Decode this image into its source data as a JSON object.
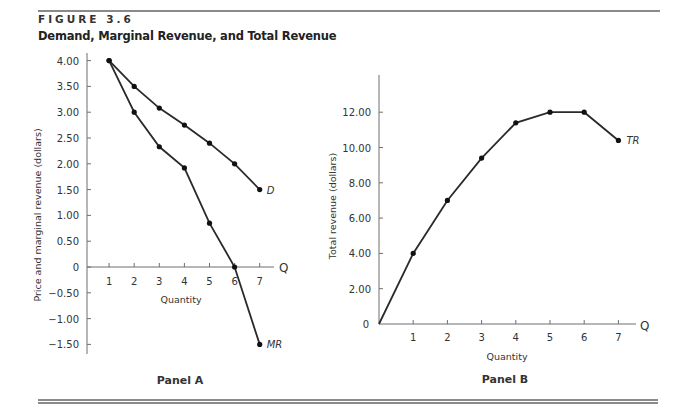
{
  "figure": {
    "number": "FIGURE 3.6",
    "title": "Demand, Marginal Revenue, and Total Revenue"
  },
  "chart_data": [
    {
      "type": "line",
      "panel": "Panel A",
      "title": "Panel A",
      "xlabel": "Quantity",
      "ylabel": "Price and marginal revenue (dollars)",
      "x_axis_symbol": "Q",
      "x": [
        1,
        2,
        3,
        4,
        5,
        6,
        7
      ],
      "x_ticks": [
        "1",
        "2",
        "3",
        "4",
        "5",
        "6",
        "7"
      ],
      "y_ticks": [
        "4.00",
        "3.50",
        "3.00",
        "2.50",
        "2.00",
        "1.50",
        "1.00",
        "0.50",
        "0",
        "-0.50",
        "-1.00",
        "-1.50"
      ],
      "ylim": [
        -1.5,
        4.0
      ],
      "xlim": [
        0,
        7
      ],
      "grid": false,
      "series": [
        {
          "name": "D",
          "label": "D",
          "values": [
            4.0,
            3.5,
            3.08,
            2.75,
            2.4,
            2.0,
            1.5
          ]
        },
        {
          "name": "MR",
          "label": "MR",
          "values": [
            4.0,
            3.0,
            2.33,
            1.92,
            0.85,
            0.0,
            -1.5
          ]
        }
      ]
    },
    {
      "type": "line",
      "panel": "Panel B",
      "title": "Panel B",
      "xlabel": "Quantity",
      "ylabel": "Total revenue (dollars)",
      "x_axis_symbol": "Q",
      "x": [
        0,
        1,
        2,
        3,
        4,
        5,
        6,
        7
      ],
      "x_ticks": [
        "1",
        "2",
        "3",
        "4",
        "5",
        "6",
        "7"
      ],
      "y_ticks": [
        "0",
        "2.00",
        "4.00",
        "6.00",
        "8.00",
        "10.00",
        "12.00"
      ],
      "ylim": [
        0,
        12.0
      ],
      "xlim": [
        0,
        7
      ],
      "grid": false,
      "series": [
        {
          "name": "TR",
          "label": "TR",
          "values": [
            0,
            4.0,
            7.0,
            9.4,
            11.4,
            12.0,
            12.0,
            10.4
          ]
        }
      ]
    }
  ],
  "colors": {
    "line": "#2a2a2a",
    "axis": "#6e6e6e",
    "rule": "#8a8a8a"
  }
}
